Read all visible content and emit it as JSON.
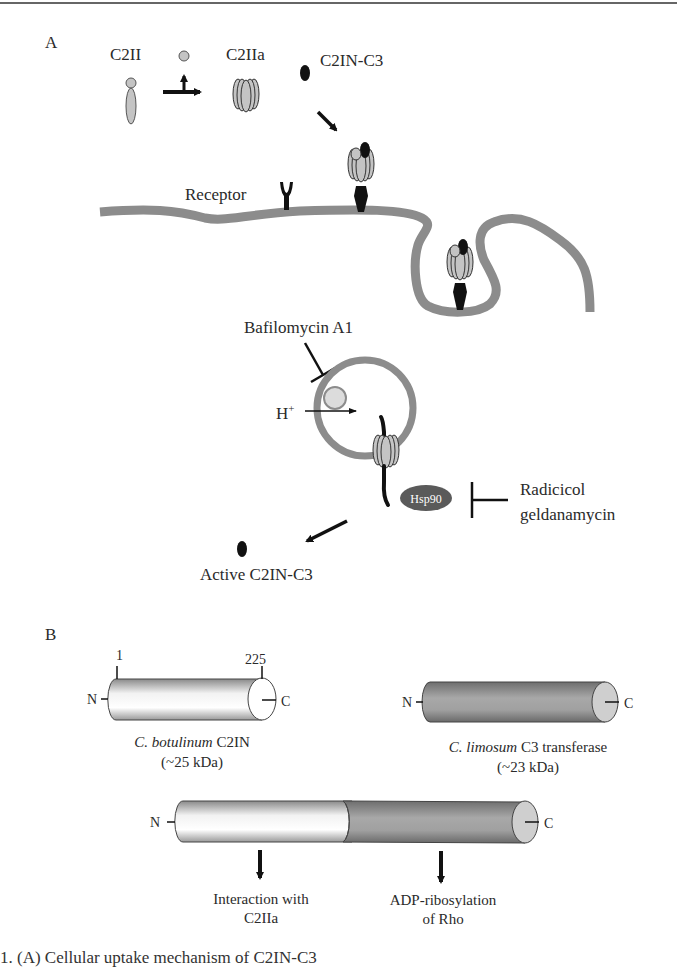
{
  "panel_a": {
    "label": "A",
    "labels": {
      "c2ii": "C2II",
      "c2iia": "C2IIa",
      "c2in_c3": "C2IN-C3",
      "receptor": "Receptor",
      "bafilomycin": "Bafilomycin A1",
      "h_plus": "H",
      "h_plus_sup": "+",
      "hsp90": "Hsp90",
      "radicicol": "Radicicol",
      "geldanamycin": "geldanamycin",
      "active": "Active C2IN-C3"
    }
  },
  "panel_b": {
    "label": "B",
    "c2in": {
      "n": "N",
      "c": "C",
      "start": "1",
      "end": "225",
      "species": "C. botulinum",
      "name": "C2IN",
      "mass": "(~25 kDa)"
    },
    "c3": {
      "n": "N",
      "c": "C",
      "species": "C. limosum",
      "name": "C3 transferase",
      "mass": "(~23 kDa)"
    },
    "fusion": {
      "n": "N",
      "c": "C",
      "left_function_line1": "Interaction with",
      "left_function_line2": "C2IIa",
      "right_function_line1": "ADP-ribosylation",
      "right_function_line2": "of Rho"
    }
  },
  "caption": "1. (A) Cellular uptake mechanism of C2IN-C3",
  "colors": {
    "membrane": "#8c8c8c",
    "protein_light": "#c4c4c4",
    "protein_dark": "#111111",
    "cylinder_dark": "#8a8a8a"
  }
}
